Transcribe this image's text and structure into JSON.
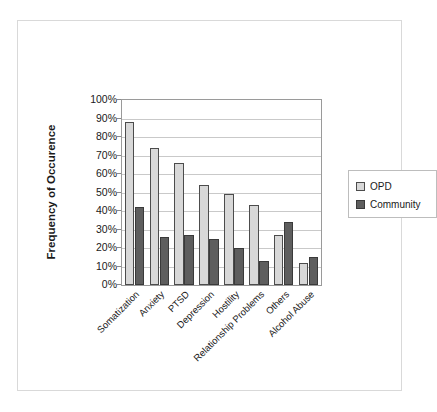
{
  "chart_data": {
    "type": "bar",
    "title": "",
    "xlabel": "",
    "ylabel": "Frequency of Occurence",
    "ylim": [
      0,
      100
    ],
    "yunit": "%",
    "grid": true,
    "legend_position": "right",
    "categories": [
      "Somatization",
      "Anxiety",
      "PTSD",
      "Depression",
      "Hostility",
      "Relationship Problems",
      "Others",
      "Alcohol Abuse"
    ],
    "ytick_labels": [
      "100%",
      "90%",
      "80%",
      "70%",
      "60%",
      "50%",
      "40%",
      "30%",
      "20%",
      "10%",
      "0%"
    ],
    "ytick_values": [
      100,
      90,
      80,
      70,
      60,
      50,
      40,
      30,
      20,
      10,
      0
    ],
    "series": [
      {
        "name": "OPD",
        "color": "#d8d8d8",
        "values": [
          88,
          74,
          66,
          54,
          49,
          43,
          27,
          12
        ]
      },
      {
        "name": "Community",
        "color": "#5e5e5e",
        "values": [
          42,
          26,
          27,
          25,
          20,
          13,
          34,
          15
        ]
      }
    ]
  },
  "legend": {
    "items": [
      {
        "label": "OPD"
      },
      {
        "label": "Community"
      }
    ]
  }
}
